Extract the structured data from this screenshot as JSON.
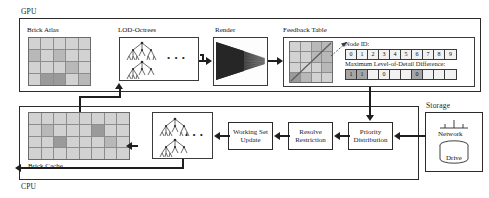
{
  "diagram": {
    "regions": {
      "gpu": {
        "label": "GPU"
      },
      "cpu": {
        "label": "CPU"
      },
      "storage": {
        "label": "Storage"
      }
    },
    "gpu_blocks": {
      "brick_atlas": {
        "label": "Brick Atlas",
        "grid": {
          "cols": 5,
          "rows": 4,
          "shades": [
            [
              1,
              1,
              1,
              1,
              1
            ],
            [
              2,
              1,
              2,
              1,
              1
            ],
            [
              1,
              1,
              1,
              2,
              1
            ],
            [
              1,
              3,
              3,
              1,
              2
            ]
          ]
        }
      },
      "lod_octrees": {
        "label": "LOD-Octrees",
        "ellipsis": "• • •",
        "tree_count": 2
      },
      "render": {
        "label": "Render"
      },
      "feedback_table": {
        "label": "Feedback Table",
        "grid": {
          "cols": 4,
          "rows": 4,
          "shades": [
            [
              1,
              1,
              2,
              2
            ],
            [
              1,
              1,
              2,
              2
            ],
            [
              1,
              1,
              1,
              2
            ],
            [
              3,
              2,
              1,
              1
            ]
          ]
        },
        "node_id": {
          "label": "Node ID:",
          "cells": [
            "0",
            "1",
            "2",
            "3",
            "4",
            "5",
            "6",
            "7",
            "8",
            "9"
          ]
        },
        "lod_difference": {
          "label": "Maximum Level-of-Detail Difference:",
          "cells": [
            "1",
            "1",
            "",
            "0",
            "",
            "",
            "0",
            "",
            "",
            ""
          ],
          "shaded": [
            true,
            true,
            false,
            false,
            false,
            false,
            true,
            false,
            false,
            false
          ]
        }
      }
    },
    "cpu_blocks": {
      "brick_cache": {
        "label": "Brick Cache",
        "grid": {
          "cols": 8,
          "rows": 4,
          "shades": [
            [
              1,
              1,
              1,
              1,
              1,
              1,
              1,
              1
            ],
            [
              1,
              2,
              1,
              1,
              1,
              3,
              1,
              1
            ],
            [
              1,
              1,
              3,
              1,
              1,
              1,
              2,
              1
            ],
            [
              1,
              1,
              1,
              1,
              1,
              1,
              1,
              1
            ]
          ]
        }
      },
      "lod_octrees": {
        "label": "",
        "ellipsis": "• • •",
        "tree_count": 2
      },
      "working_set_update": {
        "line1": "Working Set",
        "line2": "Update"
      },
      "resolve_restriction": {
        "line1": "Resolve",
        "line2": "Restriction"
      },
      "priority_distribution": {
        "line1": "Priority",
        "line2": "Distribution"
      }
    },
    "storage_blocks": {
      "network": {
        "label": "Network"
      },
      "drive": {
        "label": "Drive"
      }
    },
    "colors": {
      "stroke": "#1f1f1f",
      "box_stroke": "#2b2b2b",
      "cell_light": "#e9e9e9",
      "cell_mid": "#b8b8b8",
      "cell_dark": "#9a9a9a",
      "background": "#ffffff"
    }
  }
}
